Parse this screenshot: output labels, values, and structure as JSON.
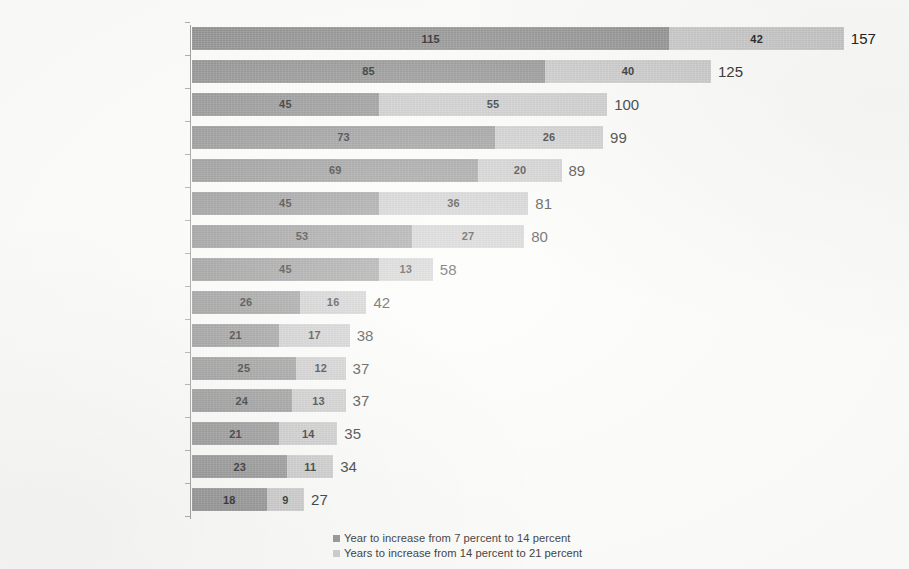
{
  "chart_data": {
    "type": "bar",
    "orientation": "horizontal",
    "stacked": true,
    "title": "",
    "xlabel": "",
    "ylabel": "",
    "grid": false,
    "xlim": [
      0,
      157
    ],
    "legend_position": "bottom-center",
    "categories": [
      "France (1865-2022)",
      "Sweden (1890-2015)",
      "iited Kingdom (1930-2030)",
      "Australia (1938-2037)",
      "United States (1944-2033)",
      "Spain (1947-2028)",
      "Hungary (1941-2021)",
      "Poland (1966-2024)",
      "Chile (1999-2041)",
      "Brazil (2012-2050)",
      "Japan (1970-2007)",
      "Tunisia (2007-2044)",
      "Thailand (2003-2038)",
      "China (2001-2035)",
      "South Korea (2000-2027)"
    ],
    "series": [
      {
        "name": "Year to increase from 7 percent to 14 percent",
        "color": "#8e8e8e",
        "values": [
          115,
          85,
          45,
          73,
          69,
          45,
          53,
          45,
          26,
          21,
          25,
          24,
          21,
          23,
          18
        ]
      },
      {
        "name": "Years to increase from 14 percent to 21 percent",
        "color": "#c9c9c9",
        "values": [
          42,
          40,
          55,
          26,
          20,
          36,
          27,
          13,
          16,
          17,
          12,
          13,
          14,
          11,
          9
        ]
      }
    ],
    "totals": [
      157,
      125,
      100,
      99,
      89,
      81,
      80,
      58,
      42,
      38,
      37,
      37,
      35,
      34,
      27
    ]
  },
  "legend": {
    "items": [
      {
        "label": "Year to increase from 7 percent to 14 percent",
        "color": "#8e8e8e"
      },
      {
        "label": "Years to increase from 14 percent to 21 percent",
        "color": "#c9c9c9"
      }
    ]
  },
  "colors": {
    "series1": "#8e8e8e",
    "series2": "#c9c9c9",
    "axis": "#9a9a9a",
    "text": "#231f20",
    "background": "#fbfbf9"
  }
}
